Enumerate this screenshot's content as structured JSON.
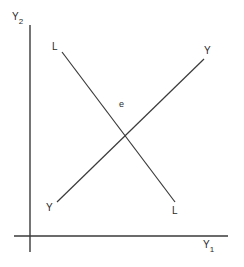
{
  "diagram": {
    "type": "economics-intersection-diagram",
    "axes": {
      "vertical": {
        "label": "Y",
        "subscript": "2"
      },
      "horizontal": {
        "label": "Y",
        "subscript": "1"
      }
    },
    "lines": [
      {
        "name": "L",
        "start_label": "L",
        "end_label": "L",
        "direction": "downward-sloping"
      },
      {
        "name": "Y",
        "start_label": "Y",
        "end_label": "Y",
        "direction": "upward-sloping"
      }
    ],
    "intersection": {
      "label": "e"
    },
    "colors": {
      "ink": "#3a3a3a",
      "background": "#ffffff"
    }
  }
}
